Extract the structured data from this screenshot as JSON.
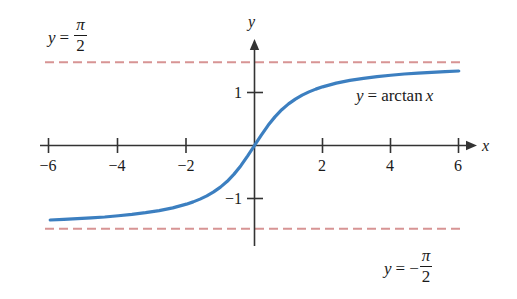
{
  "chart_data": {
    "type": "line",
    "title": "",
    "function_label": "y = arctan x",
    "xlabel": "x",
    "ylabel": "y",
    "xlim": [
      -6.6,
      6.8
    ],
    "ylim": [
      -1.95,
      1.95
    ],
    "grid": false,
    "legend_position": "inline-annotation",
    "series": [
      {
        "name": "y = arctan x",
        "color": "#3c7fc0",
        "x": [
          -6.0,
          -5.6,
          -5.2,
          -4.8,
          -4.4,
          -4.0,
          -3.6,
          -3.2,
          -2.8,
          -2.4,
          -2.0,
          -1.8,
          -1.6,
          -1.4,
          -1.2,
          -1.0,
          -0.8,
          -0.6,
          -0.4,
          -0.2,
          0.0,
          0.2,
          0.4,
          0.6,
          0.8,
          1.0,
          1.2,
          1.4,
          1.6,
          1.8,
          2.0,
          2.4,
          2.8,
          3.2,
          3.6,
          4.0,
          4.4,
          4.8,
          5.2,
          5.6,
          6.0
        ],
        "y": [
          -1.406,
          -1.392,
          -1.381,
          -1.366,
          -1.349,
          -1.326,
          -1.3,
          -1.268,
          -1.228,
          -1.176,
          -1.107,
          -1.064,
          -1.012,
          -0.951,
          -0.876,
          -0.785,
          -0.675,
          -0.54,
          -0.381,
          -0.197,
          0.0,
          0.197,
          0.381,
          0.54,
          0.675,
          0.785,
          0.876,
          0.951,
          1.012,
          1.064,
          1.107,
          1.176,
          1.228,
          1.268,
          1.3,
          1.326,
          1.349,
          1.366,
          1.381,
          1.392,
          1.406
        ]
      }
    ],
    "asymptotes": [
      {
        "name": "upper-asymptote",
        "label": "y = pi/2",
        "y_value": 1.5708,
        "color": "#d79494",
        "style": "dashed"
      },
      {
        "name": "lower-asymptote",
        "label": "y = -pi/2",
        "y_value": -1.5708,
        "color": "#d79494",
        "style": "dashed"
      }
    ],
    "x_ticks": [
      -6,
      -4,
      -2,
      2,
      4,
      6
    ],
    "x_tick_labels": [
      "−6",
      "−4",
      "−2",
      "2",
      "4",
      "6"
    ],
    "y_ticks": [
      1,
      -1
    ],
    "y_tick_labels": [
      "1",
      "−1"
    ],
    "axis_color": "#333333",
    "background": "#ffffff"
  },
  "labels": {
    "upper_asymptote": {
      "lhs_var": "y",
      "equals": "=",
      "numerator": "π",
      "denominator": "2",
      "sign": ""
    },
    "lower_asymptote": {
      "lhs_var": "y",
      "equals": "=",
      "numerator": "π",
      "denominator": "2",
      "sign": "−"
    },
    "curve_label": {
      "lhs_var": "y",
      "equals": "=",
      "function_name": "arctan",
      "argument": "x"
    },
    "x_axis_name": "x",
    "y_axis_name": "y"
  }
}
